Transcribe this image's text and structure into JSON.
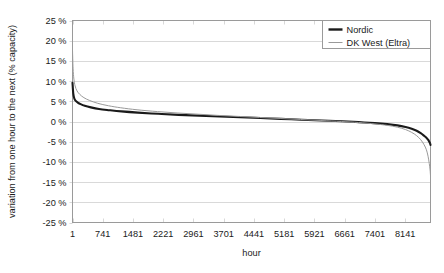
{
  "chart_data": {
    "type": "line",
    "title": "",
    "xlabel": "hour",
    "ylabel": "variation from one hour to the next (% capacity)",
    "xlim": [
      1,
      8760
    ],
    "ylim": [
      -25,
      25
    ],
    "grid": true,
    "legend_position": "top-right",
    "xticks": [
      1,
      741,
      1481,
      2221,
      2961,
      3701,
      4441,
      5181,
      5921,
      6661,
      7401,
      8141
    ],
    "xticklabels": [
      "1",
      "741",
      "1481",
      "2221",
      "2961",
      "3701",
      "4441",
      "5181",
      "5921",
      "6661",
      "7401",
      "8141"
    ],
    "yticks": [
      25,
      20,
      15,
      10,
      5,
      0,
      -5,
      -10,
      -15,
      -20,
      -25
    ],
    "yticklabels": [
      "25 %",
      "20 %",
      "15 %",
      "10 %",
      "5 %",
      "0 %",
      "-5 %",
      "-10 %",
      "-15 %",
      "-20 %",
      "-25 %"
    ],
    "series": [
      {
        "name": "Nordic",
        "color": "#1a1a1a",
        "width": 2.1,
        "x": [
          1,
          20,
          45,
          80,
          130,
          200,
          300,
          450,
          650,
          900,
          1200,
          1600,
          2100,
          2600,
          3100,
          3600,
          4100,
          4600,
          5100,
          5600,
          6100,
          6600,
          7000,
          7400,
          7700,
          7950,
          8150,
          8300,
          8420,
          8520,
          8600,
          8660,
          8700,
          8730,
          8750,
          8760
        ],
        "y": [
          9.6,
          6.9,
          5.7,
          5.1,
          4.7,
          4.3,
          3.9,
          3.5,
          3.1,
          2.8,
          2.5,
          2.2,
          1.9,
          1.65,
          1.45,
          1.25,
          1.05,
          0.85,
          0.65,
          0.45,
          0.25,
          0.05,
          -0.15,
          -0.4,
          -0.65,
          -0.95,
          -1.35,
          -1.8,
          -2.3,
          -2.9,
          -3.5,
          -4.0,
          -4.5,
          -5.0,
          -5.4,
          -5.8
        ]
      },
      {
        "name": "DK West (Eltra)",
        "color": "#9a9a9a",
        "width": 1.0,
        "x": [
          1,
          15,
          35,
          65,
          110,
          180,
          280,
          420,
          620,
          880,
          1180,
          1580,
          2080,
          2580,
          3080,
          3580,
          4080,
          4580,
          5080,
          5580,
          6080,
          6580,
          7000,
          7400,
          7700,
          7950,
          8150,
          8300,
          8420,
          8520,
          8600,
          8660,
          8700,
          8730,
          8750,
          8760
        ],
        "y": [
          17.6,
          13.2,
          10.5,
          8.8,
          7.6,
          6.7,
          5.9,
          5.2,
          4.5,
          3.9,
          3.4,
          2.9,
          2.45,
          2.1,
          1.8,
          1.5,
          1.25,
          1.0,
          0.75,
          0.5,
          0.25,
          0.0,
          -0.25,
          -0.6,
          -0.95,
          -1.4,
          -2.0,
          -2.7,
          -3.5,
          -4.5,
          -5.7,
          -7.0,
          -8.6,
          -10.4,
          -12.0,
          -13.4
        ]
      }
    ]
  },
  "legend": {
    "items": [
      {
        "label": "Nordic",
        "color": "#1a1a1a",
        "width": 2.4
      },
      {
        "label": "DK West (Eltra)",
        "color": "#9a9a9a",
        "width": 1.0
      }
    ]
  },
  "axis": {
    "x_title": "hour",
    "y_title": "variation from one hour to the next (% capacity)"
  },
  "colors": {
    "plot_border": "#9a9a9a",
    "gridline": "#d9d9d9",
    "text": "#1a1a1a",
    "background": "#ffffff"
  }
}
